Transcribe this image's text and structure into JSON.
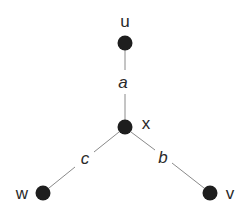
{
  "diagram": {
    "type": "graph",
    "colors": {
      "node": "#1e1e1e",
      "edge": "#8a8a8a",
      "text": "#2a2a2a",
      "background": "#ffffff"
    },
    "nodes": [
      {
        "id": "u",
        "label": "u",
        "x": 125,
        "y": 43,
        "label_x": 125,
        "label_y": 27
      },
      {
        "id": "x",
        "label": "x",
        "x": 125,
        "y": 127,
        "label_x": 146,
        "label_y": 129
      },
      {
        "id": "w",
        "label": "w",
        "x": 43,
        "y": 193,
        "label_x": 22,
        "label_y": 199
      },
      {
        "id": "v",
        "label": "v",
        "x": 210,
        "y": 193,
        "label_x": 230,
        "label_y": 199
      }
    ],
    "edges": [
      {
        "id": "a",
        "label": "a",
        "from": "x",
        "to": "u",
        "label_x": 123,
        "label_y": 88
      },
      {
        "id": "b",
        "label": "b",
        "from": "x",
        "to": "v",
        "label_x": 163,
        "label_y": 163
      },
      {
        "id": "c",
        "label": "c",
        "from": "x",
        "to": "w",
        "label_x": 85,
        "label_y": 164
      }
    ]
  }
}
